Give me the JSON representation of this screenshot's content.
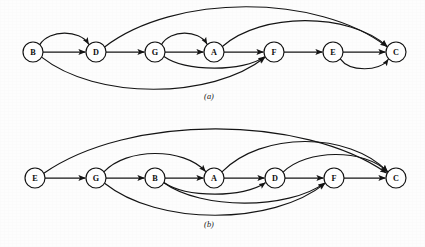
{
  "figure": {
    "background_color": "#fdfdfd",
    "ink_color": "#141414",
    "node_fill_color": "#ffffff",
    "node_radius": 10.0,
    "arrow_marker": "filled-triangle-arrowhead"
  },
  "panels": [
    {
      "id": "a",
      "caption": "(a)",
      "caption_x": 209,
      "caption_y": 99,
      "baseline_y": 52,
      "nodes": [
        {
          "label": "B",
          "x": 33,
          "y": 52
        },
        {
          "label": "D",
          "x": 96,
          "y": 52
        },
        {
          "label": "G",
          "x": 155,
          "y": 52
        },
        {
          "label": "A",
          "x": 214,
          "y": 52
        },
        {
          "label": "F",
          "x": 274,
          "y": 52
        },
        {
          "label": "E",
          "x": 333,
          "y": 52
        },
        {
          "label": "C",
          "x": 396,
          "y": 52
        }
      ],
      "edges": [
        {
          "from": "B",
          "to": "D",
          "kind": "spine",
          "bow": 0
        },
        {
          "from": "D",
          "to": "G",
          "kind": "spine",
          "bow": 0
        },
        {
          "from": "G",
          "to": "A",
          "kind": "spine",
          "bow": 0
        },
        {
          "from": "A",
          "to": "F",
          "kind": "spine",
          "bow": 0
        },
        {
          "from": "F",
          "to": "E",
          "kind": "spine",
          "bow": 0
        },
        {
          "from": "E",
          "to": "C",
          "kind": "spine",
          "bow": 0
        },
        {
          "from": "B",
          "to": "D",
          "kind": "arc-up",
          "bow": 17
        },
        {
          "from": "G",
          "to": "A",
          "kind": "arc-up",
          "bow": 17
        },
        {
          "from": "A",
          "to": "C",
          "kind": "arc-up",
          "bow": 30
        },
        {
          "from": "D",
          "to": "C",
          "kind": "arc-up",
          "bow": 44
        },
        {
          "from": "G",
          "to": "F",
          "kind": "arc-down",
          "bow": 15
        },
        {
          "from": "B",
          "to": "F",
          "kind": "arc-down",
          "bow": 36
        },
        {
          "from": "E",
          "to": "C",
          "kind": "arc-down",
          "bow": 15
        }
      ]
    },
    {
      "id": "b",
      "caption": "(b)",
      "caption_x": 209,
      "caption_y": 227,
      "baseline_y": 178,
      "nodes": [
        {
          "label": "E",
          "x": 35,
          "y": 178
        },
        {
          "label": "G",
          "x": 96,
          "y": 178
        },
        {
          "label": "B",
          "x": 155,
          "y": 178
        },
        {
          "label": "A",
          "x": 214,
          "y": 178
        },
        {
          "label": "D",
          "x": 275,
          "y": 178
        },
        {
          "label": "F",
          "x": 334,
          "y": 178
        },
        {
          "label": "C",
          "x": 396,
          "y": 178
        }
      ],
      "edges": [
        {
          "from": "E",
          "to": "G",
          "kind": "spine",
          "bow": 0
        },
        {
          "from": "G",
          "to": "B",
          "kind": "spine",
          "bow": 0
        },
        {
          "from": "B",
          "to": "A",
          "kind": "spine",
          "bow": 0
        },
        {
          "from": "A",
          "to": "D",
          "kind": "spine",
          "bow": 0
        },
        {
          "from": "D",
          "to": "F",
          "kind": "spine",
          "bow": 0
        },
        {
          "from": "F",
          "to": "C",
          "kind": "spine",
          "bow": 0
        },
        {
          "from": "G",
          "to": "A",
          "kind": "arc-up",
          "bow": 23
        },
        {
          "from": "D",
          "to": "C",
          "kind": "arc-up",
          "bow": 22
        },
        {
          "from": "A",
          "to": "C",
          "kind": "arc-up",
          "bow": 35
        },
        {
          "from": "E",
          "to": "C",
          "kind": "arc-up",
          "bow": 48
        },
        {
          "from": "B",
          "to": "D",
          "kind": "arc-down",
          "bow": 15
        },
        {
          "from": "B",
          "to": "F",
          "kind": "arc-down",
          "bow": 24
        },
        {
          "from": "G",
          "to": "F",
          "kind": "arc-down",
          "bow": 36
        }
      ]
    }
  ],
  "graph_data": {
    "type": "diagram",
    "description": "Two directed acyclic graphs drawn as linear topological orderings with arc edges",
    "panel_a": {
      "ordering": [
        "B",
        "D",
        "G",
        "A",
        "F",
        "E",
        "C"
      ],
      "edge_list": [
        [
          "B",
          "D"
        ],
        [
          "B",
          "D"
        ],
        [
          "B",
          "F"
        ],
        [
          "D",
          "G"
        ],
        [
          "D",
          "C"
        ],
        [
          "G",
          "A"
        ],
        [
          "G",
          "A"
        ],
        [
          "G",
          "F"
        ],
        [
          "A",
          "F"
        ],
        [
          "A",
          "C"
        ],
        [
          "F",
          "E"
        ],
        [
          "E",
          "C"
        ],
        [
          "E",
          "C"
        ]
      ]
    },
    "panel_b": {
      "ordering": [
        "E",
        "G",
        "B",
        "A",
        "D",
        "F",
        "C"
      ],
      "edge_list": [
        [
          "E",
          "G"
        ],
        [
          "E",
          "C"
        ],
        [
          "G",
          "B"
        ],
        [
          "G",
          "A"
        ],
        [
          "G",
          "F"
        ],
        [
          "B",
          "A"
        ],
        [
          "B",
          "D"
        ],
        [
          "B",
          "F"
        ],
        [
          "A",
          "D"
        ],
        [
          "A",
          "C"
        ],
        [
          "D",
          "F"
        ],
        [
          "D",
          "C"
        ],
        [
          "F",
          "C"
        ]
      ]
    }
  }
}
